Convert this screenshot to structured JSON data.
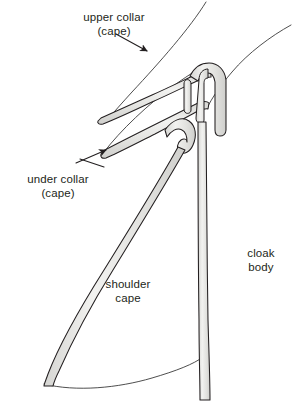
{
  "figure": {
    "background_color": "#ffffff",
    "outline_color": "#231f20",
    "band_fill_color": "#e8e8e6",
    "band_shade_color": "#d2d2cf",
    "thin_line_color": "#3a3a3a"
  },
  "labels": {
    "upper_collar": {
      "line1": "upper collar",
      "line2": "(cape)"
    },
    "under_collar": {
      "line1": "under collar",
      "line2": "(cape)"
    },
    "shoulder_cape": {
      "line1": "shoulder",
      "line2": "cape"
    },
    "cloak_body": {
      "line1": "cloak",
      "line2": "body"
    }
  },
  "leader_lines": {
    "upper_collar_arrow": "arrow pointing down-right from upper collar label to the upper collar band",
    "under_collar_arrow": "arrow pointing up-right from under collar label to the under collar band"
  }
}
